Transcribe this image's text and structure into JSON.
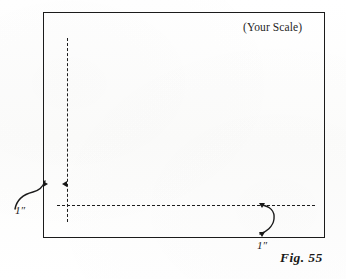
{
  "figure": {
    "caption": "Fig. 55",
    "frame": {
      "scale_note": "(Your Scale)"
    },
    "dimensions": {
      "left_margin_label": "1″",
      "bottom_margin_label": "1″"
    },
    "icons": {
      "left_edge_tick": "arrow-right-marker",
      "left_guide_tick": "arrow-left-marker",
      "bottom_upper_tick": "arrow-down-marker",
      "bottom_lower_tick": "arrow-down-marker",
      "left_leader": "curved-leader-line",
      "bottom_leader": "curved-leader-line"
    },
    "colors": {
      "ink": "#1b1b1b",
      "paper": "#fdfdfd"
    }
  }
}
